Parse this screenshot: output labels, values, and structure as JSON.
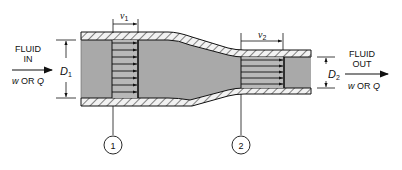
{
  "diagram": {
    "type": "pipe-reducer-flow",
    "inlet": {
      "label_line1": "FLUID",
      "label_line2": "IN",
      "flow_label": "w OR Q",
      "flow_w": "w",
      "flow_or": "OR",
      "flow_q": "Q"
    },
    "outlet": {
      "label_line1": "FLUID",
      "label_line2": "OUT",
      "flow_label": "w OR Q",
      "flow_w": "w",
      "flow_or": "OR",
      "flow_q": "Q"
    },
    "section1": {
      "number": "1",
      "diameter_label": "D",
      "diameter_sub": "1",
      "velocity_label": "v",
      "velocity_sub": "1"
    },
    "section2": {
      "number": "2",
      "diameter_label": "D",
      "diameter_sub": "2",
      "velocity_label": "v",
      "velocity_sub": "2"
    },
    "colors": {
      "fluid": "#a8a8a8",
      "fluid_dark": "#9a9a9a",
      "wall": "#e8e8e8",
      "line": "#111111"
    }
  }
}
